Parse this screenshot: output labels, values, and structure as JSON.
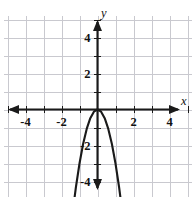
{
  "figure": {
    "width": 196,
    "height": 197,
    "background_color": "#ffffff"
  },
  "chart_data": {
    "type": "line",
    "title": "",
    "subtitle": "",
    "xlabel": "x",
    "ylabel": "y",
    "xlim": [
      -5.4,
      5.4
    ],
    "ylim": [
      -5.5,
      5.4
    ],
    "grid": true,
    "grid_color": "#c9c9cf",
    "grid_step": 1,
    "axis_color": "#1a1a1a",
    "curve_color": "#1a1a1a",
    "legend": null,
    "legend_position": "none",
    "x_tick_labels": [
      "-4",
      "-2",
      "2",
      "4"
    ],
    "x_tick_values": [
      -4,
      -2,
      2,
      4
    ],
    "y_tick_labels": [
      "4",
      "2",
      "-2",
      "-4"
    ],
    "y_tick_values": [
      4,
      2,
      -2,
      -4
    ],
    "annotations": [],
    "series": [
      {
        "name": "parabola",
        "equation": "y = -3x^2",
        "vertex": [
          0,
          0
        ],
        "opens": "down",
        "arrow_ends": "both",
        "x": [
          -1.37,
          -1.2,
          -1.0,
          -0.8,
          -0.6,
          -0.4,
          -0.2,
          0.0,
          0.2,
          0.4,
          0.6,
          0.8,
          1.0,
          1.2,
          1.37
        ],
        "values": [
          -5.63,
          -4.32,
          -3.0,
          -1.92,
          -1.08,
          -0.48,
          -0.12,
          0.0,
          -0.12,
          -0.48,
          -1.08,
          -1.92,
          -3.0,
          -4.32,
          -5.63
        ]
      }
    ]
  },
  "axes": {
    "x_axis_name": "x",
    "y_axis_name": "y",
    "x_arrow_left": true,
    "x_arrow_right": true,
    "y_arrow_up": true,
    "y_arrow_down": true
  }
}
